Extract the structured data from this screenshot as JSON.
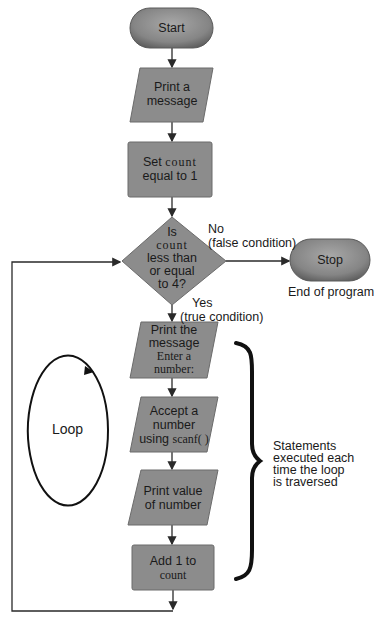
{
  "colors": {
    "shape_fill": "#8c8c8c",
    "shape_stroke": "#6b6b6b",
    "terminal_fill": "#858585",
    "line": "#2a2a2a",
    "brace": "#111111"
  },
  "nodes": {
    "start": {
      "label": "Start"
    },
    "print_message": {
      "line1": "Print a",
      "line2": "message"
    },
    "set_count": {
      "prefix": "Set ",
      "code": "count",
      "line2": "equal to 1"
    },
    "decision": {
      "line1": "Is",
      "code": "count",
      "line3": "less than",
      "line4": "or equal",
      "line5": "to 4?"
    },
    "stop": {
      "label": "Stop"
    },
    "print_prompt": {
      "line1": "Print the",
      "line2": "message",
      "code1": "Enter a",
      "code2": "number:"
    },
    "accept_number": {
      "line1": "Accept a",
      "line2": "number",
      "line3_prefix": "using ",
      "code": "scanf( )"
    },
    "print_value": {
      "line1": "Print value",
      "line2": "of number"
    },
    "add_one": {
      "line1": "Add 1 to",
      "code": "count"
    }
  },
  "labels": {
    "no_branch": {
      "line1": "No",
      "line2": "(false condition)"
    },
    "yes_branch": {
      "line1": "Yes",
      "line2": "(true condition)"
    },
    "end_of_program": "End of program",
    "loop": "Loop",
    "statements_note": {
      "line1": "Statements",
      "line2": "executed each",
      "line3": "time the loop",
      "line4": "is traversed"
    }
  }
}
